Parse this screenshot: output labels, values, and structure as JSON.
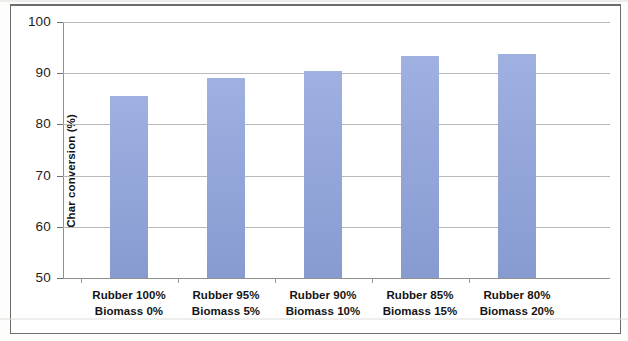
{
  "chart_data": {
    "type": "bar",
    "title": "",
    "xlabel": "",
    "ylabel": "Char conversion (%)",
    "ylim": [
      50,
      100
    ],
    "yticks": [
      50,
      60,
      70,
      80,
      90,
      100
    ],
    "ytick_labels": [
      "50",
      "60",
      "70",
      "80",
      "90",
      "100"
    ],
    "grid": true,
    "legend": "none",
    "bar_color": "#8fa3dc",
    "categories": [
      "Rubber 100% Biomass 0%",
      "Rubber 95% Biomass 5%",
      "Rubber 90% Biomass 10%",
      "Rubber 85% Biomass 15%",
      "Rubber 80% Biomass 20%"
    ],
    "category_lines": [
      {
        "line1": "Rubber 100%",
        "line2": "Biomass 0%"
      },
      {
        "line1": "Rubber 95%",
        "line2": "Biomass 5%"
      },
      {
        "line1": "Rubber 90%",
        "line2": "Biomass 10%"
      },
      {
        "line1": "Rubber 85%",
        "line2": "Biomass 15%"
      },
      {
        "line1": "Rubber 80%",
        "line2": "Biomass 20%"
      }
    ],
    "values": [
      85.5,
      89.0,
      90.4,
      93.3,
      93.8
    ]
  }
}
